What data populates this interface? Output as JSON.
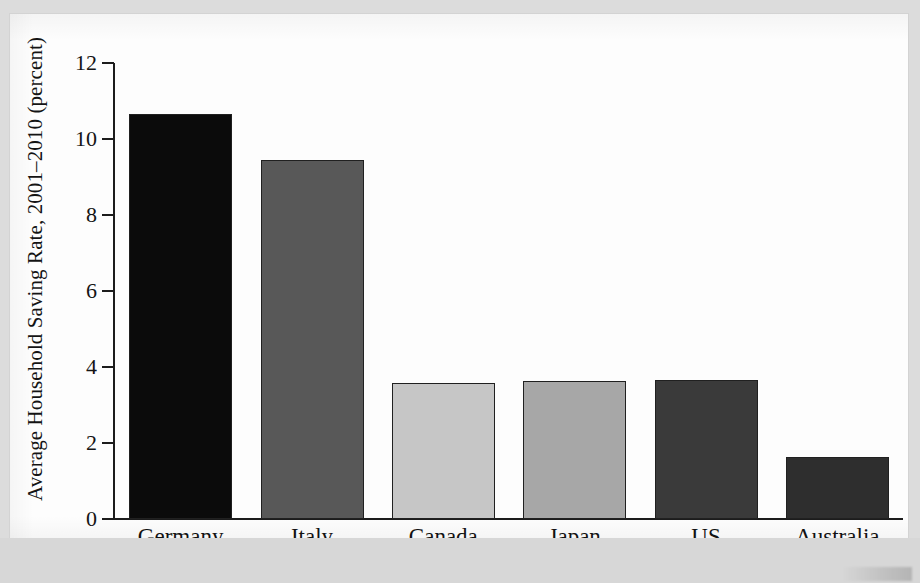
{
  "chart_data": {
    "type": "bar",
    "title": "",
    "xlabel": "",
    "ylabel": "Average Household Saving Rate, 2001–2010 (percent)",
    "categories": [
      "Germany",
      "Italy",
      "Canada",
      "Japan",
      "US",
      "Australia"
    ],
    "values": [
      10.65,
      9.45,
      3.58,
      3.62,
      3.65,
      1.63
    ],
    "bar_colors": [
      "#0b0b0b",
      "#585858",
      "#c6c6c6",
      "#a7a7a7",
      "#3a3a3a",
      "#2e2e2e"
    ],
    "ylim": [
      0,
      12
    ],
    "yticks": [
      0,
      2,
      4,
      6,
      8,
      10,
      12
    ],
    "ytick_labels": [
      "0",
      "2",
      "4",
      "6",
      "8",
      "10",
      "12"
    ],
    "grid": false,
    "legend": "none",
    "axis_color": "#1c1c1c",
    "background": "#fdfdfd"
  }
}
